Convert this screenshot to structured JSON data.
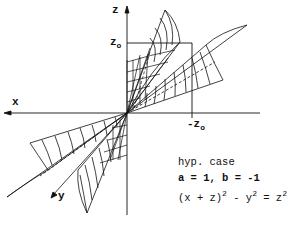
{
  "figure": {
    "type": "line-drawing",
    "axes": {
      "z_label": "z",
      "x_label": "x",
      "y_label": "y",
      "z0_label": "z",
      "z0_sub": "o",
      "neg_z0_label": "-z",
      "neg_z0_sub": "o"
    },
    "annotation": {
      "line1": "hyp. case",
      "line2": "a = 1, b = -1",
      "line3_a": "(x + z)",
      "line3_sup1": "2",
      "line3_b": " - y",
      "line3_sup2": "2",
      "line3_c": " = z",
      "line3_sup3": "2"
    },
    "colors": {
      "ink": "#111111",
      "paper": "#ffffff"
    }
  }
}
